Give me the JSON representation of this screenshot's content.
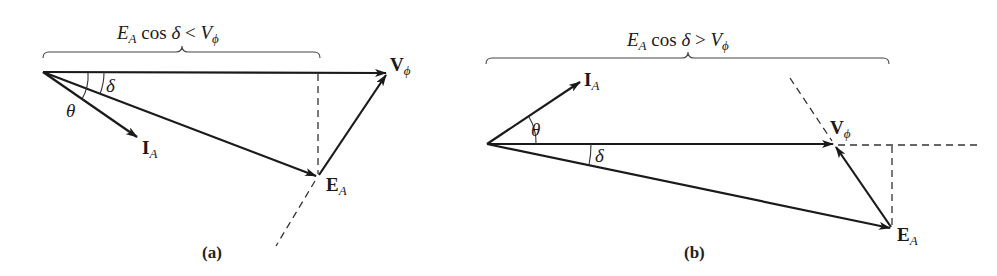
{
  "figure": {
    "panels": [
      {
        "id": "a",
        "caption": "(a)",
        "condition": {
          "lhs_main": "E",
          "lhs_sub": "A",
          "func": " cos ",
          "angle": "δ",
          "op": " < ",
          "rhs_main": "V",
          "rhs_sub": "ϕ"
        },
        "phasors": {
          "voltage": {
            "main": "V",
            "sub": "ϕ"
          },
          "emf": {
            "main": "E",
            "sub": "A"
          },
          "current": {
            "main": "I",
            "sub": "A"
          }
        },
        "angles": {
          "theta": "θ",
          "delta": "δ"
        }
      },
      {
        "id": "b",
        "caption": "(b)",
        "condition": {
          "lhs_main": "E",
          "lhs_sub": "A",
          "func": " cos ",
          "angle": "δ",
          "op": " > ",
          "rhs_main": "V",
          "rhs_sub": "ϕ"
        },
        "phasors": {
          "voltage": {
            "main": "V",
            "sub": "ϕ"
          },
          "emf": {
            "main": "E",
            "sub": "A"
          },
          "current": {
            "main": "I",
            "sub": "A"
          }
        },
        "angles": {
          "theta": "θ",
          "delta": "δ"
        }
      }
    ]
  }
}
